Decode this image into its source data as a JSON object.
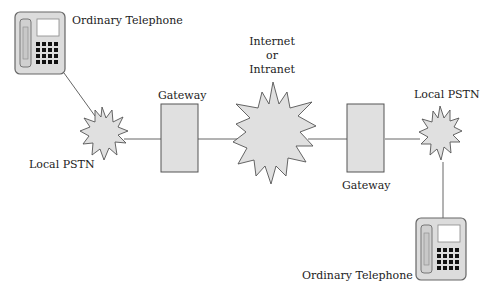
{
  "diagram": {
    "colors": {
      "fill": "#e0e0e0",
      "stroke": "#555555",
      "line": "#666666",
      "keypad": "#111111",
      "screen": "#ffffff"
    },
    "nodes": {
      "telephone_left": {
        "label": "Ordinary Telephone",
        "icon": "telephone-icon"
      },
      "pstn_left": {
        "label": "Local PSTN",
        "icon": "starburst-cloud-icon"
      },
      "gateway_left": {
        "label": "Gateway",
        "icon": "gateway-box"
      },
      "internet": {
        "label_lines": [
          "Internet",
          "or",
          "Intranet"
        ],
        "icon": "starburst-cloud-icon"
      },
      "gateway_right": {
        "label": "Gateway",
        "icon": "gateway-box"
      },
      "pstn_right": {
        "label": "Local PSTN",
        "icon": "starburst-cloud-icon"
      },
      "telephone_right": {
        "label": "Ordinary Telephone",
        "icon": "telephone-icon"
      }
    },
    "connections": [
      [
        "telephone_left",
        "pstn_left"
      ],
      [
        "pstn_left",
        "gateway_left"
      ],
      [
        "gateway_left",
        "internet"
      ],
      [
        "internet",
        "gateway_right"
      ],
      [
        "gateway_right",
        "pstn_right"
      ],
      [
        "pstn_right",
        "telephone_right"
      ]
    ]
  }
}
